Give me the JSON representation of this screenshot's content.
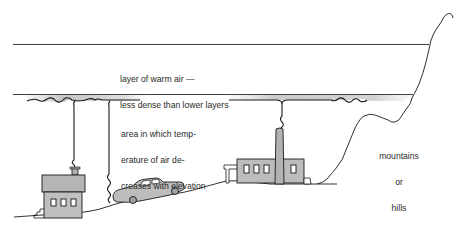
{
  "diagram": {
    "labels": {
      "warm_layer": [
        "layer of warm air —",
        "less dense than lower layers"
      ],
      "cooling_area": [
        "area in which temp-",
        "erature of air de-",
        "creases with elevation"
      ],
      "terrain": [
        "mountains",
        "or",
        "hills"
      ]
    },
    "elements": [
      {
        "id": "warm-layer-top-line",
        "kind": "line"
      },
      {
        "id": "inversion-base-line",
        "kind": "line"
      },
      {
        "id": "house",
        "kind": "drawing"
      },
      {
        "id": "car",
        "kind": "drawing"
      },
      {
        "id": "factory",
        "kind": "drawing"
      },
      {
        "id": "mountain-slope",
        "kind": "drawing"
      },
      {
        "id": "smoke-plumes",
        "kind": "drawing",
        "count": 3
      }
    ],
    "colors": {
      "ink": "#1a1a1a",
      "fill_gray": "#b8b8b8",
      "smog_gray": "#c9c9c9",
      "background": "#ffffff"
    }
  }
}
